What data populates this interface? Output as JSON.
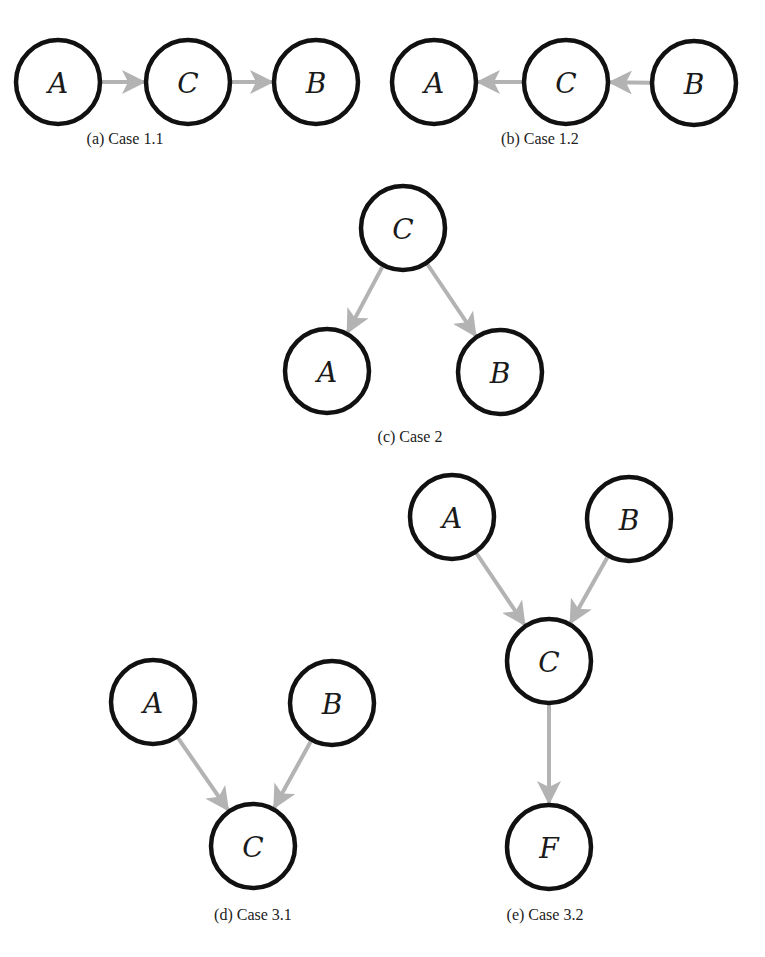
{
  "figure": {
    "edge_color": "#b3b3b3",
    "node_stroke": "#111111",
    "panels": [
      {
        "id": "a",
        "caption": "(a) Case 1.1",
        "caption_pos": [
          125,
          144
        ],
        "nodes": [
          {
            "label": "A",
            "x": 58,
            "y": 82
          },
          {
            "label": "C",
            "x": 188,
            "y": 82
          },
          {
            "label": "B",
            "x": 316,
            "y": 82
          }
        ],
        "edges": [
          [
            "A",
            "C"
          ],
          [
            "C",
            "B"
          ]
        ]
      },
      {
        "id": "b",
        "caption": "(b) Case 1.2",
        "caption_pos": [
          540,
          144
        ],
        "nodes": [
          {
            "label": "A",
            "x": 434,
            "y": 82
          },
          {
            "label": "C",
            "x": 566,
            "y": 82
          },
          {
            "label": "B",
            "x": 694,
            "y": 83
          }
        ],
        "edges": [
          [
            "C",
            "A"
          ],
          [
            "B",
            "C"
          ]
        ]
      },
      {
        "id": "c",
        "caption": "(c) Case 2",
        "caption_pos": [
          410,
          442
        ],
        "nodes": [
          {
            "label": "C",
            "x": 403,
            "y": 228
          },
          {
            "label": "A",
            "x": 327,
            "y": 371
          },
          {
            "label": "B",
            "x": 500,
            "y": 372
          }
        ],
        "edges": [
          [
            "C",
            "A"
          ],
          [
            "C",
            "B"
          ]
        ]
      },
      {
        "id": "d",
        "caption": "(d) Case 3.1",
        "caption_pos": [
          253,
          920
        ],
        "nodes": [
          {
            "label": "A",
            "x": 153,
            "y": 702
          },
          {
            "label": "B",
            "x": 332,
            "y": 703
          },
          {
            "label": "C",
            "x": 253,
            "y": 846
          }
        ],
        "edges": [
          [
            "A",
            "C"
          ],
          [
            "B",
            "C"
          ]
        ]
      },
      {
        "id": "e",
        "caption": "(e) Case 3.2",
        "caption_pos": [
          545,
          920
        ],
        "nodes": [
          {
            "label": "A",
            "x": 452,
            "y": 517
          },
          {
            "label": "B",
            "x": 629,
            "y": 519
          },
          {
            "label": "C",
            "x": 549,
            "y": 661
          },
          {
            "label": "F",
            "x": 549,
            "y": 847
          }
        ],
        "edges": [
          [
            "A",
            "C"
          ],
          [
            "B",
            "C"
          ],
          [
            "C",
            "F"
          ]
        ]
      }
    ]
  }
}
